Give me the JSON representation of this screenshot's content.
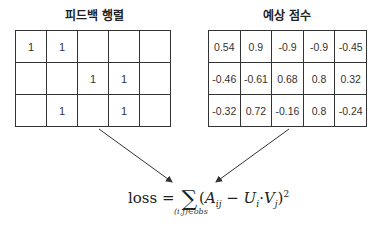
{
  "feedback_matrix": {
    "title": "피드백 행렬",
    "rows": [
      [
        "1",
        "1",
        "",
        "",
        ""
      ],
      [
        "",
        "",
        "1",
        "1",
        ""
      ],
      [
        "",
        "1",
        "",
        "1",
        ""
      ]
    ]
  },
  "prediction_matrix": {
    "title": "예상 점수",
    "rows": [
      [
        "0.54",
        "0.9",
        "-0.9",
        "-0.9",
        "-0.45"
      ],
      [
        "-0.46",
        "-0.61",
        "0.68",
        "0.8",
        "0.32"
      ],
      [
        "-0.32",
        "0.72",
        "-0.16",
        "0.8",
        "-0.24"
      ]
    ]
  },
  "formula": {
    "lhs": "loss",
    "equals": "=",
    "sum": "∑",
    "open": "(",
    "A": "A",
    "A_sub": "ij",
    "minus": " − ",
    "U": "U",
    "U_sub": "i",
    "dot": "·",
    "V": "V",
    "V_sub": "j",
    "close": ")",
    "power": "2",
    "sum_subscript": "(i,j)∈obs"
  }
}
